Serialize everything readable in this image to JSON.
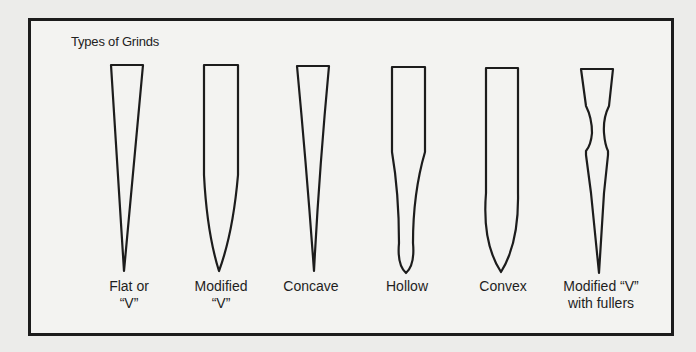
{
  "diagram": {
    "title": "Types of Grinds",
    "grinds": [
      {
        "id": "flat",
        "label_line1": "Flat or",
        "label_line2": "“V”"
      },
      {
        "id": "modified-v",
        "label_line1": "Modified",
        "label_line2": "“V”"
      },
      {
        "id": "concave",
        "label_line1": "Concave",
        "label_line2": ""
      },
      {
        "id": "hollow",
        "label_line1": "Hollow",
        "label_line2": ""
      },
      {
        "id": "convex",
        "label_line1": "Convex",
        "label_line2": ""
      },
      {
        "id": "modified-v-fullers",
        "label_line1": "Modified “V”",
        "label_line2": "with fullers"
      }
    ],
    "colors": {
      "stroke": "#1c1c1c",
      "background": "#f3f3f1"
    }
  }
}
